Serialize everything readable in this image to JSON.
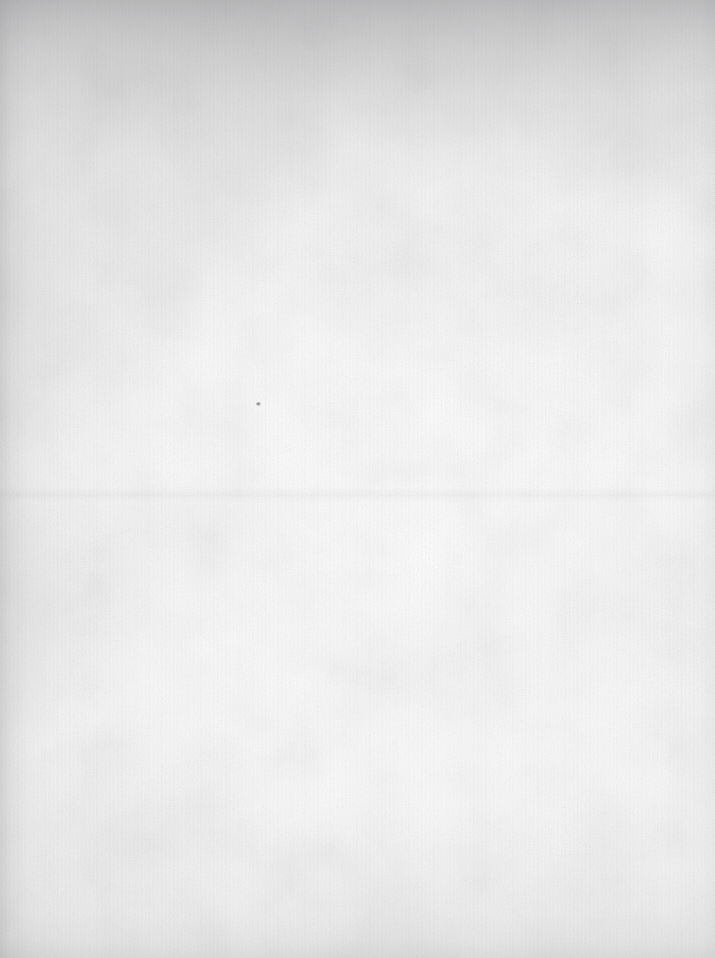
{
  "document": {
    "kind": "scanned-paper-background",
    "title": "Blank Aged Paper Scan",
    "description": "A featureless scan of an old, lightly soiled sheet of paper. No text, figures, rules, or interface elements are present anywhere on the surface.",
    "width_px": 715,
    "height_px": 958,
    "orientation": "portrait",
    "text_content": "",
    "visible_text_blocks": [],
    "visible_numbers": [],
    "icons": []
  },
  "appearance": {
    "base_color": "#f6f6f6",
    "brightest_color": "#fdfdfd",
    "center_color": "#fbfbfb",
    "mid_tone_color": "#f1f1f1",
    "darkest_edge_color": "#c8c8c8",
    "grain_color": "#8a8a8e",
    "fiber_color": "#909094",
    "tint": "neutral-cool-gray",
    "surface": "matte uncoated paper"
  },
  "features": {
    "vignette": {
      "top": "strongest — broad dark band across the entire top edge, deepest at the upper-left and upper-centre corners",
      "left": "moderate — soft dark gradient running the full height of the left margin",
      "bottom": "light — faint darkening along the lower edge",
      "right": "minimal — the right margin is the cleanest and brightest edge"
    },
    "grain": "fine mottled pulp speckle distributed evenly over the whole sheet",
    "fibers": "faint vertical striations resembling scanner line noise, most visible along the left and right margins",
    "clouds": "soft irregular blotches of discolouration concentrated near the top edge and in the lower-left corner",
    "crease": {
      "type": "horizontal fold line",
      "y_px": 495,
      "note": "very faint full-width crease a little above the vertical midpoint"
    },
    "speck": {
      "type": "small dark debris mark",
      "x_px": 258,
      "y_px": 404,
      "size_px": 5
    }
  }
}
